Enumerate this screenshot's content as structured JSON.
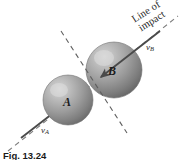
{
  "figure": {
    "caption": "Fig. 13.24",
    "background_color": "#ffffff",
    "width": 181,
    "height": 160,
    "line_of_impact_label": {
      "line1": "Line of",
      "line2": "impact"
    },
    "bodies": [
      {
        "name": "sphere-a",
        "label": "A",
        "center_x": 68,
        "center_y": 100,
        "radius": 25,
        "fill_color": "#9a9a9a",
        "highlight_color": "#cfcfcf",
        "shadow_color": "#6e6e6e"
      },
      {
        "name": "sphere-b",
        "label": "B",
        "center_x": 114,
        "center_y": 70,
        "radius": 28,
        "fill_color": "#9a9a9a",
        "highlight_color": "#cfcfcf",
        "shadow_color": "#6e6e6e"
      }
    ],
    "vectors": [
      {
        "name": "velocity-a",
        "label": "v",
        "subscript": "A",
        "from_x": 21,
        "from_y": 138,
        "to_x": 78,
        "to_y": 94,
        "color": "#4a4a4a"
      },
      {
        "name": "velocity-b",
        "label": "v",
        "subscript": "B",
        "from_x": 160,
        "from_y": 31,
        "to_x": 100,
        "to_y": 78,
        "color": "#4a4a4a"
      }
    ],
    "dashed_lines": [
      {
        "name": "line-of-impact-axis",
        "from_x": 8,
        "from_y": 151,
        "to_x": 178,
        "to_y": 16,
        "color": "#7d7d7d",
        "dash": "5,4"
      },
      {
        "name": "plane-of-contact-line",
        "from_x": 61,
        "from_y": 31,
        "to_x": 127,
        "to_y": 133,
        "color": "#6d6d6d",
        "dash": "5,4"
      }
    ],
    "contact_point": {
      "x": 91,
      "y": 84
    }
  }
}
